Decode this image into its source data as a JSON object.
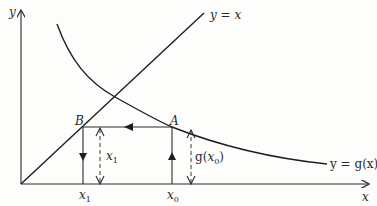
{
  "figure": {
    "axes": {
      "x_label": "x",
      "y_label": "y"
    },
    "lines": {
      "identity_label": "y = x",
      "curve_label": "y = g(x)"
    },
    "points": {
      "A": "A",
      "B": "B"
    },
    "ticks": {
      "x1": "x",
      "x1_sub": "1",
      "x0": "x",
      "x0_sub": "0"
    },
    "dimensions": {
      "x1_height": "x",
      "x1_height_sub": "1",
      "gx0_prefix": "g(",
      "gx0_var": "x",
      "gx0_sub": "0",
      "gx0_suffix": ")"
    }
  },
  "colors": {
    "ink": "#1e1e1e",
    "paper": "#fdfdfb"
  }
}
